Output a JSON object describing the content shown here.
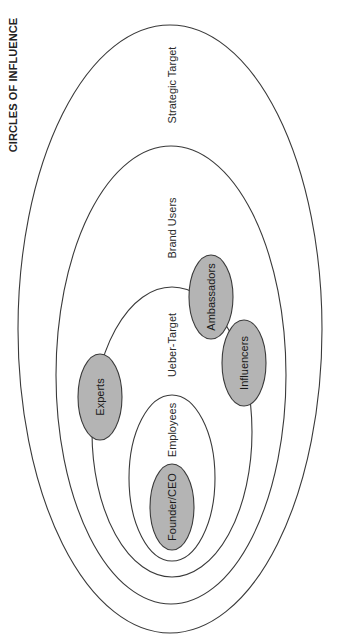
{
  "title": "CIRCLES OF INFLUENCE",
  "colors": {
    "stroke": "#3a3a3a",
    "node_fill": "#b4b4b4",
    "background": "#ffffff"
  },
  "orientation": "rotated 90 degrees counter-clockwise (text reads bottom-to-top)",
  "rings": [
    {
      "label": "Strategic Target",
      "level": 1
    },
    {
      "label": "Brand Users",
      "level": 2
    },
    {
      "label": "Ueber-Target",
      "level": 3
    },
    {
      "label": "Employees",
      "level": 4
    }
  ],
  "nodes": [
    {
      "label": "Founder/CEO",
      "ring": "Employees"
    },
    {
      "label": "Experts",
      "ring": "Ueber-Target"
    },
    {
      "label": "Ambassadors",
      "ring": "Ueber-Target"
    },
    {
      "label": "Influencers",
      "ring": "Ueber-Target"
    }
  ]
}
